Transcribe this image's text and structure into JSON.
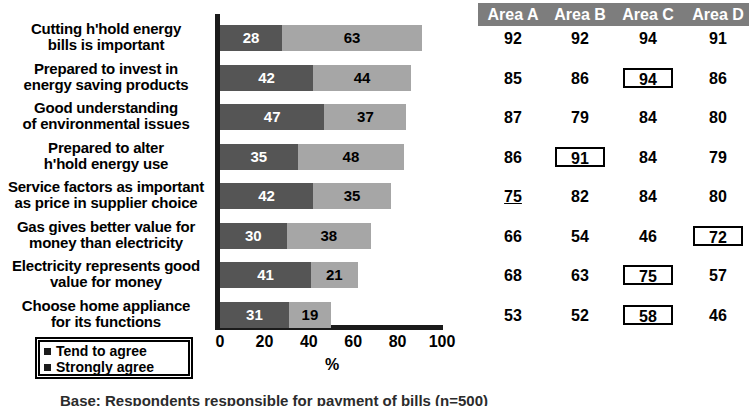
{
  "chart_data": {
    "type": "bar",
    "orientation": "horizontal",
    "stacked": true,
    "title": "",
    "xlabel": "%",
    "ylabel": "",
    "xlim": [
      0,
      100
    ],
    "xticks": [
      0,
      20,
      40,
      60,
      80,
      100
    ],
    "grid": false,
    "legend_position": "bottom-left",
    "categories": [
      "Cutting h'hold energy bills is important",
      "Prepared to invest in energy saving products",
      "Good understanding of environmental issues",
      "Prepared to alter h'hold energy use",
      "Service factors as important as price in supplier choice",
      "Gas gives better value for money than electricity",
      "Electricity represents good value for money",
      "Choose home appliance for its functions"
    ],
    "series": [
      {
        "name": "Strongly agree",
        "values": [
          28,
          42,
          47,
          35,
          42,
          30,
          41,
          31
        ],
        "color": "#555555"
      },
      {
        "name": "Tend to agree",
        "values": [
          63,
          44,
          37,
          48,
          35,
          38,
          21,
          19
        ],
        "color": "#a6a6a6"
      }
    ]
  },
  "labels": [
    {
      "l1": "Cutting h'hold energy",
      "l2": "bills is important"
    },
    {
      "l1": "Prepared to invest in",
      "l2": "energy saving products"
    },
    {
      "l1": "Good understanding",
      "l2": "of environmental issues"
    },
    {
      "l1": "Prepared to alter",
      "l2": "h'hold energy use"
    },
    {
      "l1": "Service factors as important",
      "l2": "as price in supplier choice"
    },
    {
      "l1": "Gas gives better value for",
      "l2": "money than electricity"
    },
    {
      "l1": "Electricity represents good",
      "l2": "value for money"
    },
    {
      "l1": "Choose home appliance",
      "l2": "for its functions"
    }
  ],
  "bars": [
    {
      "strong": "28",
      "tend": "63"
    },
    {
      "strong": "42",
      "tend": "44"
    },
    {
      "strong": "47",
      "tend": "37"
    },
    {
      "strong": "35",
      "tend": "48"
    },
    {
      "strong": "42",
      "tend": "35"
    },
    {
      "strong": "30",
      "tend": "38"
    },
    {
      "strong": "41",
      "tend": "21"
    },
    {
      "strong": "31",
      "tend": "19"
    }
  ],
  "axis": {
    "ticks": [
      "0",
      "20",
      "40",
      "60",
      "80",
      "100"
    ],
    "unit": "%"
  },
  "legend": {
    "items": [
      {
        "label": "Tend to agree"
      },
      {
        "label": "Strongly agree"
      }
    ]
  },
  "table": {
    "headers": [
      "Area A",
      "Area B",
      "Area C",
      "Area D"
    ],
    "rows": [
      [
        {
          "v": "92"
        },
        {
          "v": "92"
        },
        {
          "v": "94"
        },
        {
          "v": "91"
        }
      ],
      [
        {
          "v": "85"
        },
        {
          "v": "86"
        },
        {
          "v": "94",
          "box": true
        },
        {
          "v": "86"
        }
      ],
      [
        {
          "v": "87"
        },
        {
          "v": "79"
        },
        {
          "v": "84"
        },
        {
          "v": "80"
        }
      ],
      [
        {
          "v": "86"
        },
        {
          "v": "91",
          "box": true
        },
        {
          "v": "84"
        },
        {
          "v": "79"
        }
      ],
      [
        {
          "v": "75",
          "underline": true
        },
        {
          "v": "82"
        },
        {
          "v": "84"
        },
        {
          "v": "80"
        }
      ],
      [
        {
          "v": "66"
        },
        {
          "v": "54"
        },
        {
          "v": "46"
        },
        {
          "v": "72",
          "box": true
        }
      ],
      [
        {
          "v": "68"
        },
        {
          "v": "63"
        },
        {
          "v": "75",
          "box": true
        },
        {
          "v": "57"
        }
      ],
      [
        {
          "v": "53"
        },
        {
          "v": "52"
        },
        {
          "v": "58",
          "box": true
        },
        {
          "v": "46"
        }
      ]
    ]
  },
  "caption": "Base: Respondents responsible for payment of bills (n=500)",
  "colors": {
    "strongly_agree": "#555555",
    "tend_to_agree": "#a6a6a6",
    "header_band": "#7d7d7d",
    "axis": "#1b1b1b"
  }
}
